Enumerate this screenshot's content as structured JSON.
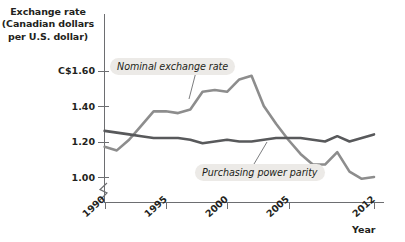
{
  "chart_data": {
    "type": "line",
    "title": "Exchange rate (Canadian dollars per U.S. dollar)",
    "title_lines": [
      "Exchange rate",
      "(Canadian dollars",
      "per U.S. dollar)"
    ],
    "xlabel": "Year",
    "ylabel": "Exchange rate (Canadian dollars per U.S. dollar)",
    "grid": false,
    "legend_position": "inline-callouts",
    "y_axis_break": true,
    "y_axis_break_note": "axis broken below 1.00",
    "ylim": [
      0.96,
      1.66
    ],
    "xlim": [
      1990,
      2012
    ],
    "yticks": [
      1.0,
      1.2,
      1.4,
      1.6
    ],
    "ytick_labels": [
      "1.00",
      "1.20",
      "1.40",
      "C$1.60"
    ],
    "xticks": [
      1990,
      1995,
      2000,
      2005,
      2012
    ],
    "xtick_labels": [
      "1990",
      "1995",
      "2000",
      "2005",
      "2012"
    ],
    "x": [
      1990,
      1991,
      1992,
      1993,
      1994,
      1995,
      1996,
      1997,
      1998,
      1999,
      2000,
      2001,
      2002,
      2003,
      2004,
      2005,
      2006,
      2007,
      2008,
      2009,
      2010,
      2011,
      2012
    ],
    "series": [
      {
        "name": "Nominal exchange rate",
        "color": "#8d8d8d",
        "values": [
          1.17,
          1.15,
          1.21,
          1.29,
          1.37,
          1.37,
          1.36,
          1.38,
          1.48,
          1.49,
          1.48,
          1.55,
          1.57,
          1.4,
          1.3,
          1.21,
          1.13,
          1.07,
          1.07,
          1.14,
          1.03,
          0.99,
          1.0
        ]
      },
      {
        "name": "Purchasing power parity",
        "color": "#58595b",
        "values": [
          1.26,
          1.25,
          1.24,
          1.23,
          1.22,
          1.22,
          1.22,
          1.21,
          1.19,
          1.2,
          1.21,
          1.2,
          1.2,
          1.21,
          1.22,
          1.22,
          1.22,
          1.21,
          1.2,
          1.23,
          1.2,
          1.22,
          1.24
        ]
      }
    ],
    "annotations": [
      {
        "text": "Nominal exchange rate",
        "points_to_year": 2000,
        "style": "italic-callout"
      },
      {
        "text": "Purchasing power parity",
        "points_to_year": 2002,
        "style": "italic-callout"
      }
    ]
  }
}
